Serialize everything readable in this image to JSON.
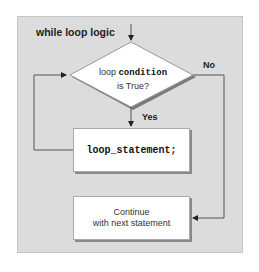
{
  "diagram": {
    "title": "while loop logic",
    "decision": {
      "prefix": "loop ",
      "keyword": "condition",
      "suffix": "is True?"
    },
    "yes_label": "Yes",
    "no_label": "No",
    "loop_box": "loop_statement;",
    "continue_box": {
      "line1": "Continue",
      "line2": "with next statement"
    }
  },
  "colors": {
    "panel": "#dcdcdc",
    "box": "#ffffff",
    "line": "#555555"
  }
}
